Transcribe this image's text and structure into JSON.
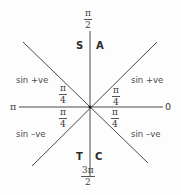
{
  "diagram": {
    "type": "unit-circle-quadrant-diagram",
    "colors": {
      "line": "#4a4a4a",
      "text": "#3a3a3a",
      "background": "#fdfdfd"
    },
    "axis_labels": {
      "top": {
        "numerator": "π",
        "denominator": "2"
      },
      "bottom": {
        "numerator": "3π",
        "denominator": "2"
      },
      "left": "π",
      "right": "0"
    },
    "quadrant_letters": {
      "top_left": "S",
      "top_right": "A",
      "bottom_left": "T",
      "bottom_right": "C"
    },
    "region_labels": {
      "upper_left": "sin +ve",
      "upper_right": "sin +ve",
      "lower_left": "sin –ve",
      "lower_right": "sin –ve"
    },
    "angle_labels": [
      {
        "position": "upper-left",
        "numerator": "π",
        "denominator": "4"
      },
      {
        "position": "upper-right",
        "numerator": "π",
        "denominator": "4"
      },
      {
        "position": "lower-left",
        "numerator": "π",
        "denominator": "4"
      },
      {
        "position": "lower-right",
        "numerator": "π",
        "denominator": "4"
      }
    ]
  }
}
